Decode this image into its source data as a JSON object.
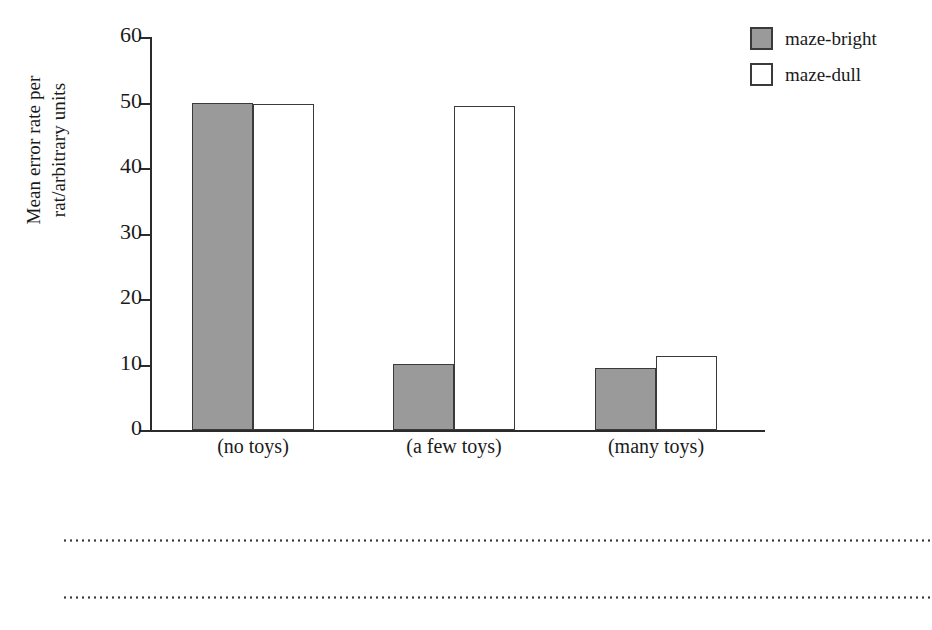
{
  "chart_data": {
    "type": "bar",
    "title": "",
    "xlabel": "",
    "ylabel": "Mean error rate per rat/arbitrary units",
    "ylabel_lines": [
      "Mean error rate per",
      "rat/arbitrary units"
    ],
    "ylim": [
      0,
      60
    ],
    "yticks": [
      0,
      10,
      20,
      30,
      40,
      50,
      60
    ],
    "ytick_labels": [
      "0",
      "10",
      "20",
      "30",
      "40",
      "50",
      "60"
    ],
    "grid": false,
    "legend_position": "top-right",
    "categories": [
      "Poor",
      "Normal",
      "Enriched"
    ],
    "category_sublabels": [
      "(no toys)",
      "(a few toys)",
      "(many toys)"
    ],
    "series": [
      {
        "name": "maze-bright",
        "color": "#9a9a9a",
        "values": [
          50.0,
          10.1,
          9.5
        ]
      },
      {
        "name": "maze-dull",
        "color": "#ffffff",
        "values": [
          49.7,
          49.4,
          11.3
        ]
      }
    ]
  },
  "legend": {
    "items": [
      {
        "label": "maze-bright",
        "swatch": "filled-gray-square"
      },
      {
        "label": "maze-dull",
        "swatch": "empty-white-square"
      }
    ]
  },
  "axes": {
    "y_tick_labels": [
      "60",
      "50",
      "40",
      "30",
      "20",
      "10",
      "0"
    ],
    "y_title_line1": "Mean error rate per",
    "y_title_line2": "rat/arbitrary units"
  },
  "groups": [
    {
      "name": "Poor",
      "sublabel": "(no toys)",
      "bright": 50.0,
      "dull": 49.7
    },
    {
      "name": "Normal",
      "sublabel": "(a few toys)",
      "bright": 10.1,
      "dull": 49.4
    },
    {
      "name": "Enriched",
      "sublabel": "(many toys)",
      "bright": 9.5,
      "dull": 11.3
    }
  ],
  "decoration": {
    "dotted_rule_1": "",
    "dotted_rule_2": ""
  },
  "colors": {
    "bright_fill": "#9a9a9a",
    "dull_fill": "#ffffff",
    "stroke": "#3a3a3a",
    "axis": "#2b2b2b"
  }
}
